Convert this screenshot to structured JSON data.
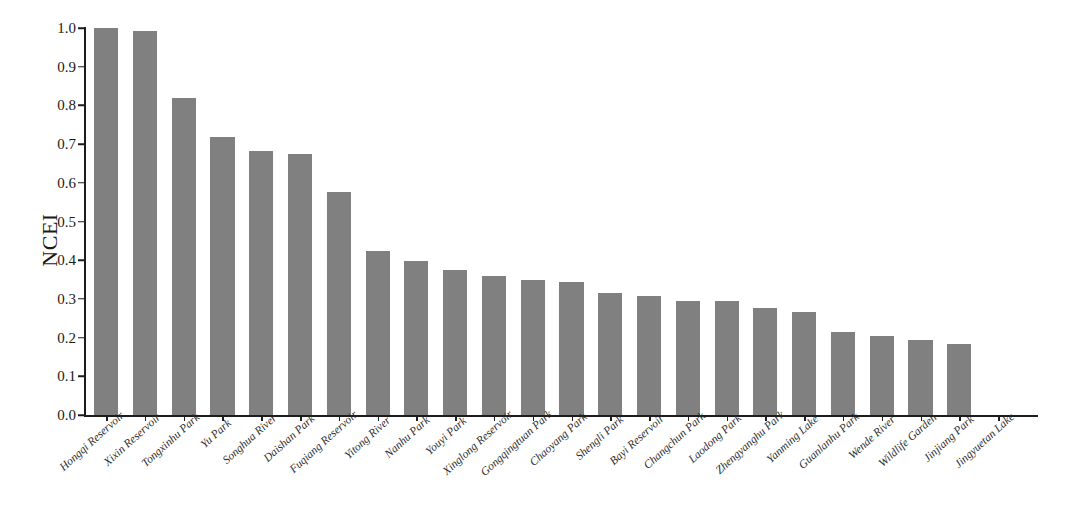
{
  "chart_data": {
    "type": "bar",
    "title": "",
    "subtitle": "",
    "xlabel": "",
    "ylabel": "NCEI",
    "ylim": [
      0.0,
      1.0
    ],
    "grid": false,
    "legend": null,
    "bar_color": "#808080",
    "axis_color": "#1c1c1c",
    "text_color": "#1a1a1a",
    "ytick_labels": [
      "1.0",
      "0.9",
      "0.8",
      "0.7",
      "0.6",
      "0.5",
      "0.4",
      "0.3",
      "0.2",
      "0.1",
      "0.0"
    ],
    "ytick_values": [
      1.0,
      0.9,
      0.8,
      0.7,
      0.6,
      0.5,
      0.4,
      0.3,
      0.2,
      0.1,
      0.0
    ],
    "categories": [
      "Hongqi Reservoir",
      "Xixin Reservoir",
      "Tongxinhu Park",
      "Yu Park",
      "Songhua River",
      "Daishan Park",
      "Fuqiang Reservoir",
      "Yitong River",
      "Nanhu Park",
      "Youyi Park",
      "Xinglong Reservoir",
      "Gongqingtuan Park",
      "Chaoyang Park",
      "Shengli Park",
      "Bayi Reservoir",
      "Changchun Park",
      "Laodong Park",
      "Zhengyanghu Park",
      "Yanming Lake",
      "Guanlanhu Park",
      "Wende River",
      "Wildlife Garden",
      "Jinjiang Park",
      "Jingyuetan Lake"
    ],
    "values": [
      1.0,
      0.992,
      0.819,
      0.718,
      0.683,
      0.674,
      0.577,
      0.424,
      0.397,
      0.374,
      0.359,
      0.35,
      0.345,
      0.316,
      0.308,
      0.295,
      0.294,
      0.277,
      0.267,
      0.215,
      0.203,
      0.194,
      0.184,
      0.0
    ]
  }
}
